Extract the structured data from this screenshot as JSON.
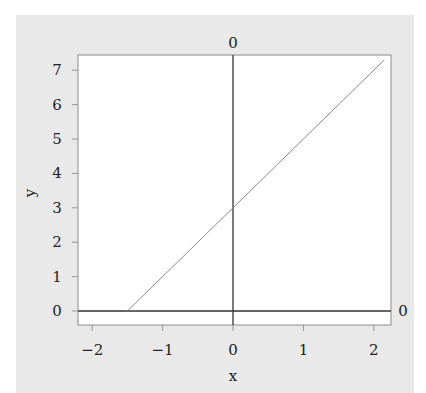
{
  "chart_data": {
    "type": "line",
    "title": "",
    "xlabel": "x",
    "ylabel": "y",
    "xlim": [
      -2.2,
      2.2
    ],
    "ylim": [
      -0.4,
      7.45
    ],
    "x_ticks": [
      "-2",
      "-1",
      "0",
      "1",
      "2"
    ],
    "y_ticks": [
      "0",
      "1",
      "2",
      "3",
      "4",
      "5",
      "6",
      "7"
    ],
    "grid": false,
    "series": [
      {
        "name": "y = 2x + 3",
        "x": [
          -1.5,
          2.15
        ],
        "y": [
          0,
          7.3
        ],
        "color": "#8a8a8a"
      }
    ],
    "reference_lines": [
      {
        "orientation": "vertical",
        "value": 0,
        "label": "0",
        "color": "#333333"
      },
      {
        "orientation": "horizontal",
        "value": 0,
        "label": "0",
        "color": "#333333"
      }
    ]
  },
  "colors": {
    "panel_background": "#e9e9e9",
    "plot_background": "#ffffff",
    "frame": "#8c8c8c",
    "data_line": "#8a8a8a",
    "reference_line": "#333333"
  }
}
